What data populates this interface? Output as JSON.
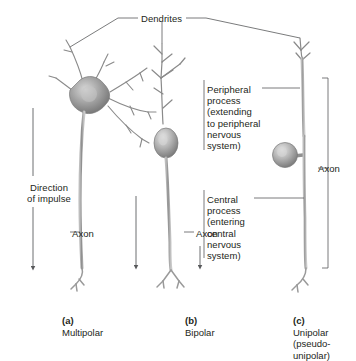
{
  "figure": {
    "title_label": "Dendrites",
    "background": "#ffffff",
    "ink": "#231f20",
    "cell_color": "#9a9a9a"
  },
  "labels": {
    "dendrites": "Dendrites",
    "direction_of_impulse": "Direction\nof impulse",
    "axon_multipolar": "Axon",
    "axon_bipolar": "Axon",
    "axon_unipolar": "Axon",
    "peripheral_process": "Peripheral\nprocess\n(extending\nto peripheral\nnervous\nsystem)",
    "central_process": "Central\nprocess\n(entering\ncentral\nnervous\nsystem)"
  },
  "captions": [
    {
      "letter": "(a)",
      "name": "Multipolar"
    },
    {
      "letter": "(b)",
      "name": "Bipolar"
    },
    {
      "letter": "(c)",
      "name": "Unipolar\n(pseudo-\nunipolar)"
    }
  ],
  "neurons": [
    {
      "id": "multipolar",
      "caption_letter": "(a)",
      "caption_name": "Multipolar",
      "soma_shape": "star",
      "dendrite_count": "many",
      "has_axon": true,
      "impulse_direction": "downward"
    },
    {
      "id": "bipolar",
      "caption_letter": "(b)",
      "caption_name": "Bipolar",
      "soma_shape": "oval-spindle",
      "dendrite_count": "one branched",
      "has_axon": true,
      "impulse_direction": "downward"
    },
    {
      "id": "unipolar",
      "caption_letter": "(c)",
      "caption_name": "Unipolar (pseudounipolar)",
      "soma_shape": "round-lateral",
      "dendrite_count": "one branched",
      "has_axon": true,
      "impulse_direction": "downward"
    }
  ]
}
